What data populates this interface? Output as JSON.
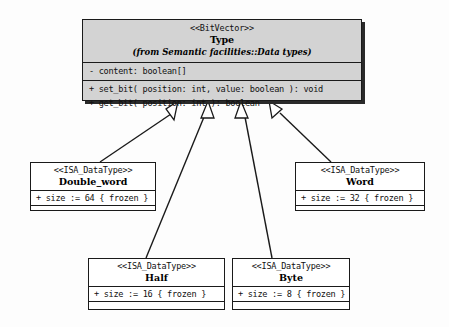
{
  "diagram": {
    "kind": "uml-class-diagram",
    "background_color": "#fdfdfd",
    "line_color": "#1a1a1a",
    "superclass_fill": "#d3d3d3",
    "subclass_fill": "#ffffff"
  },
  "superclass": {
    "stereotype": "<<BitVector>>",
    "name": "Type",
    "package_ref": "(from Semantic facilities::Data types)",
    "attributes": [
      "- content:  boolean[]"
    ],
    "operations": [
      "+ set_bit( position:  int, value:  boolean ):  void",
      "+ get_bit( position:  int ):  boolean"
    ]
  },
  "subclasses": [
    {
      "id": "double-word",
      "stereotype": "<<ISA_DataType>>",
      "name": "Double_word",
      "attributes": [
        "+ size := 64 { frozen }"
      ],
      "operations": []
    },
    {
      "id": "word",
      "stereotype": "<<ISA_DataType>>",
      "name": "Word",
      "attributes": [
        "+ size := 32 { frozen }"
      ],
      "operations": []
    },
    {
      "id": "half",
      "stereotype": "<<ISA_DataType>>",
      "name": "Half",
      "attributes": [
        "+ size := 16 { frozen }"
      ],
      "operations": []
    },
    {
      "id": "byte",
      "stereotype": "<<ISA_DataType>>",
      "name": "Byte",
      "attributes": [
        "+ size := 8 { frozen }"
      ],
      "operations": []
    }
  ],
  "generalizations": [
    {
      "from": "double-word",
      "to": "Type",
      "arrow": "hollow-triangle"
    },
    {
      "from": "half",
      "to": "Type",
      "arrow": "hollow-triangle"
    },
    {
      "from": "byte",
      "to": "Type",
      "arrow": "hollow-triangle"
    },
    {
      "from": "word",
      "to": "Type",
      "arrow": "hollow-triangle"
    }
  ]
}
